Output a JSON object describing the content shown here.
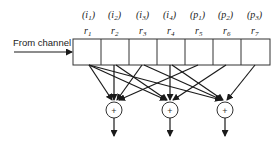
{
  "diagram": {
    "input_label": "From channel",
    "register": {
      "cells": [
        {
          "role": "i",
          "role_sub": "1",
          "name": "r",
          "sub": "1"
        },
        {
          "role": "i",
          "role_sub": "2",
          "name": "r",
          "sub": "2"
        },
        {
          "role": "i",
          "role_sub": "3",
          "name": "r",
          "sub": "3"
        },
        {
          "role": "i",
          "role_sub": "4",
          "name": "r",
          "sub": "4"
        },
        {
          "role": "p",
          "role_sub": "1",
          "name": "r",
          "sub": "5"
        },
        {
          "role": "p",
          "role_sub": "2",
          "name": "r",
          "sub": "6"
        },
        {
          "role": "p",
          "role_sub": "3",
          "name": "r",
          "sub": "7"
        }
      ]
    },
    "adders": [
      {
        "symbol": "+",
        "inputs": [
          "r1",
          "r2",
          "r3",
          "r5"
        ]
      },
      {
        "symbol": "+",
        "inputs": [
          "r1",
          "r2",
          "r4",
          "r6"
        ]
      },
      {
        "symbol": "+",
        "inputs": [
          "r1",
          "r3",
          "r4",
          "r7"
        ]
      }
    ],
    "colors": {
      "line": "#1a1a1a",
      "background": "#ffffff"
    }
  }
}
